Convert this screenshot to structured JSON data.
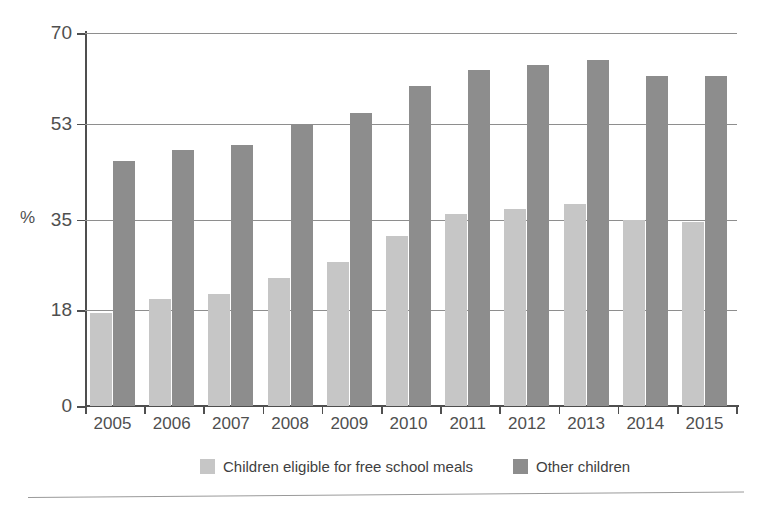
{
  "chart_data": {
    "type": "bar",
    "title": "",
    "subtitle": "",
    "xlabel": "",
    "ylabel": "%",
    "ylim": [
      0,
      70
    ],
    "yticks": [
      0,
      18,
      35,
      53,
      70
    ],
    "grid": true,
    "legend_position": "bottom",
    "categories": [
      "2005",
      "2006",
      "2007",
      "2008",
      "2009",
      "2010",
      "2011",
      "2012",
      "2013",
      "2014",
      "2015"
    ],
    "series": [
      {
        "name": "Children eligible for free school meals",
        "color": "#c6c6c6",
        "values": [
          17.5,
          20,
          21,
          24,
          27,
          32,
          36,
          37,
          38,
          35,
          34.5
        ]
      },
      {
        "name": "Other children",
        "color": "#8d8d8d",
        "values": [
          46,
          48,
          49,
          53,
          55,
          60,
          63,
          64,
          65,
          62,
          62
        ]
      }
    ]
  },
  "legend": {
    "entries": [
      {
        "label": "Children eligible for free school meals",
        "color": "#c6c6c6"
      },
      {
        "label": "Other children",
        "color": "#8d8d8d"
      }
    ]
  }
}
